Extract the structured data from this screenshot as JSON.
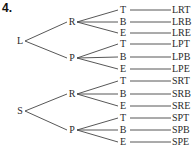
{
  "problem_number": "4.",
  "tree": {
    "roots": [
      {
        "label": "L",
        "branches": [
          {
            "label": "R",
            "leaves": [
              {
                "label": "T",
                "outcome": "LRT"
              },
              {
                "label": "B",
                "outcome": "LRB"
              },
              {
                "label": "E",
                "outcome": "LRE"
              }
            ]
          },
          {
            "label": "P",
            "leaves": [
              {
                "label": "T",
                "outcome": "LPT"
              },
              {
                "label": "B",
                "outcome": "LPB"
              },
              {
                "label": "E",
                "outcome": "LPE"
              }
            ]
          }
        ]
      },
      {
        "label": "S",
        "branches": [
          {
            "label": "R",
            "leaves": [
              {
                "label": "T",
                "outcome": "SRT"
              },
              {
                "label": "B",
                "outcome": "SRB"
              },
              {
                "label": "E",
                "outcome": "SRE"
              }
            ]
          },
          {
            "label": "P",
            "leaves": [
              {
                "label": "T",
                "outcome": "SPT"
              },
              {
                "label": "B",
                "outcome": "SPB"
              },
              {
                "label": "E",
                "outcome": "SPE"
              }
            ]
          }
        ]
      }
    ]
  },
  "line_color": "#444444"
}
